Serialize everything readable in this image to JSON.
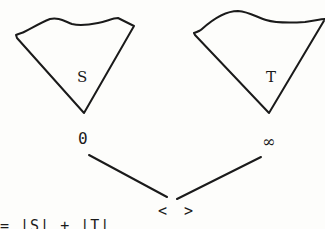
{
  "figure": {
    "trees": [
      {
        "name": "S",
        "root_label": "0"
      },
      {
        "name": "T",
        "root_label": "∞"
      }
    ],
    "join_node_label": "< >",
    "formula_partial": "=   |S|  + |T|"
  },
  "colors": {
    "ink": "#1a1a1a",
    "paper": "#fdfdfb"
  }
}
